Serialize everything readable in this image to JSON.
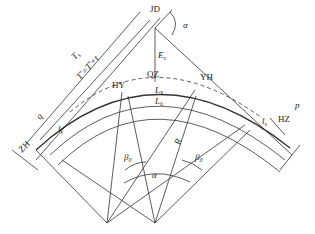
{
  "diagram": {
    "type": "highway horizontal curve with spiral transitions",
    "points": {
      "jd": "JD",
      "zh": "ZH",
      "hy": "HY",
      "qz": "QZ",
      "yh": "YH",
      "hz": "HZ"
    },
    "labels": {
      "alpha_top": "α",
      "alpha_center": "α",
      "ts": "T",
      "ts_sub": "s",
      "t_eq": "T'=T'+t",
      "q": "q",
      "ls_left": "l",
      "ls_left_sub": "s",
      "ls_right": "l",
      "ls_right_sub": "s",
      "es": "E",
      "es_sub": "s",
      "ly": "L",
      "ly_sub": "Y",
      "lh": "L",
      "lh_sub": "h",
      "p": "p",
      "r": "R",
      "beta_left": "β",
      "beta_left_sub": "0",
      "beta_right": "β",
      "beta_right_sub": "0"
    },
    "colors": {
      "line": "#333333",
      "background": "#ffffff"
    }
  }
}
